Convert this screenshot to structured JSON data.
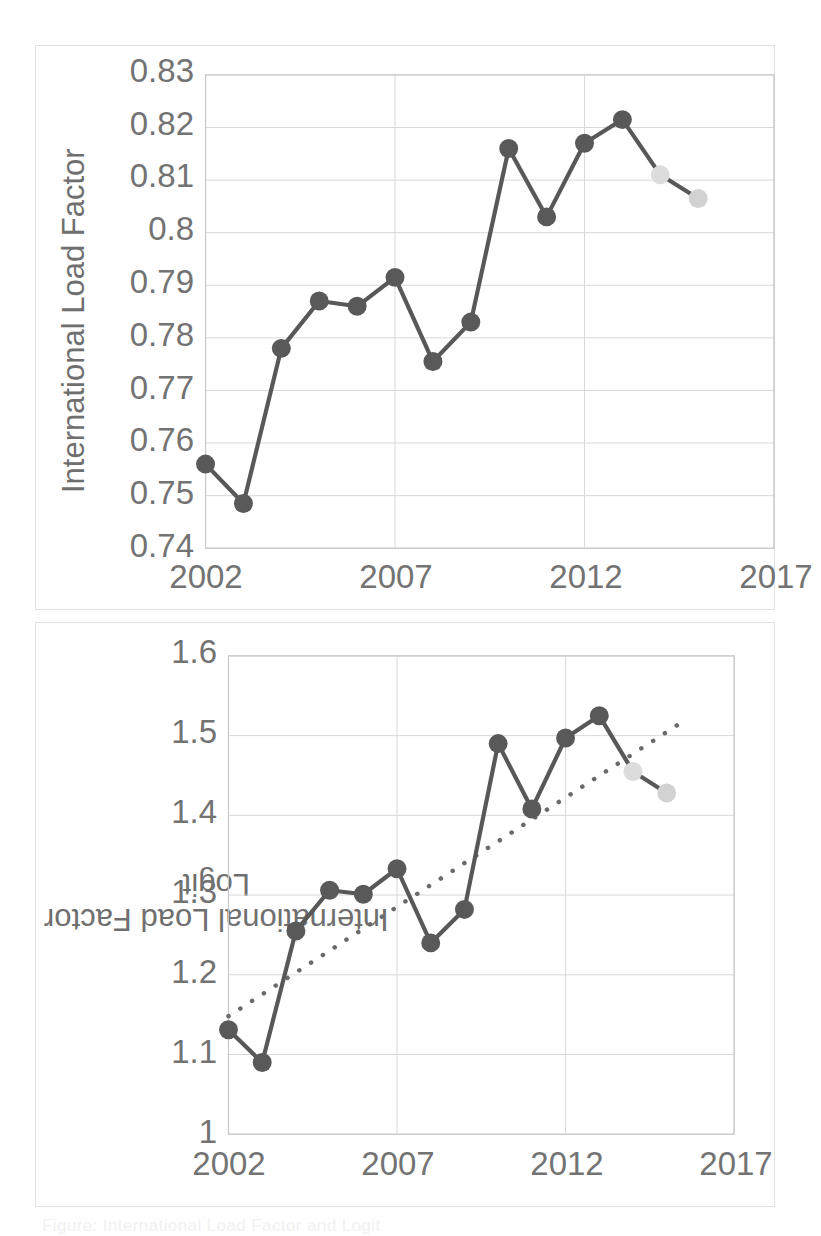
{
  "figure": {
    "caption": "Figure: International Load Factor and Logit"
  },
  "chart_data": [
    {
      "id": "top",
      "type": "line",
      "title": "",
      "xlabel": "",
      "ylabel": "International Load Factor",
      "x": [
        2002,
        2003,
        2004,
        2005,
        2006,
        2007,
        2008,
        2009,
        2010,
        2011,
        2012,
        2013,
        2014,
        2015
      ],
      "values": [
        0.756,
        0.7485,
        0.778,
        0.787,
        0.786,
        0.7915,
        0.7755,
        0.783,
        0.816,
        0.803,
        0.817,
        0.8215,
        0.811,
        0.8065
      ],
      "point_colors": [
        "dark",
        "dark",
        "dark",
        "dark",
        "dark",
        "dark",
        "dark",
        "dark",
        "dark",
        "dark",
        "dark",
        "dark",
        "light",
        "light"
      ],
      "xlim": [
        2002,
        2017
      ],
      "ylim": [
        0.74,
        0.83
      ],
      "xticks": [
        "2002",
        "2007",
        "2012",
        "2017"
      ],
      "xtick_values": [
        2002,
        2007,
        2012,
        2017
      ],
      "yticks": [
        "0.83",
        "0.82",
        "0.81",
        "0.8",
        "0.79",
        "0.78",
        "0.77",
        "0.76",
        "0.75",
        "0.74"
      ],
      "ytick_values": [
        0.83,
        0.82,
        0.81,
        0.8,
        0.79,
        0.78,
        0.77,
        0.76,
        0.75,
        0.74
      ],
      "grid": true,
      "legend": "none",
      "trendline": null
    },
    {
      "id": "bottom",
      "type": "line",
      "title": "",
      "xlabel": "",
      "ylabel": "International Load Factor\nLogit",
      "ylabel_line1": "International Load Factor",
      "ylabel_line2": "Logit",
      "x": [
        2002,
        2003,
        2004,
        2005,
        2006,
        2007,
        2008,
        2009,
        2010,
        2011,
        2012,
        2013,
        2014,
        2015
      ],
      "values": [
        1.131,
        1.09,
        1.255,
        1.306,
        1.301,
        1.333,
        1.24,
        1.282,
        1.49,
        1.408,
        1.497,
        1.525,
        1.455,
        1.428
      ],
      "point_colors": [
        "dark",
        "dark",
        "dark",
        "dark",
        "dark",
        "dark",
        "dark",
        "dark",
        "dark",
        "dark",
        "dark",
        "dark",
        "light",
        "light"
      ],
      "xlim": [
        2002,
        2017
      ],
      "ylim": [
        1.0,
        1.6
      ],
      "xticks": [
        "2002",
        "2007",
        "2012",
        "2017"
      ],
      "xtick_values": [
        2002,
        2007,
        2012,
        2017
      ],
      "yticks": [
        "1.6",
        "1.5",
        "1.4",
        "1.3",
        "1.2",
        "1.1",
        "1"
      ],
      "ytick_values": [
        1.6,
        1.5,
        1.4,
        1.3,
        1.2,
        1.1,
        1.0
      ],
      "grid": true,
      "legend": "none",
      "trendline": {
        "style": "dotted",
        "x": [
          2002,
          2015.6
        ],
        "values": [
          1.148,
          1.521
        ]
      }
    }
  ],
  "style": {
    "series_color": "#585858",
    "marker_dark": "#595959",
    "marker_light": "#dcdcdc",
    "marker_light_2": "#d2d2d2",
    "grid_color": "#d9d9d9",
    "axis_color": "#c8c8c8",
    "panel_border": "#e2e2e2",
    "tick_text_color": "#737373",
    "label_text_color": "#6f6f6f",
    "background": "#ffffff"
  }
}
